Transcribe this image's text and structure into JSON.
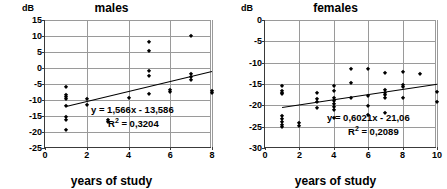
{
  "chart_data": [
    {
      "type": "scatter",
      "title": "males",
      "xlabel": "years of study",
      "ylabel": "dB",
      "xlim": [
        0,
        8
      ],
      "ylim": [
        -25,
        15
      ],
      "xticks": [
        0,
        2,
        4,
        6,
        8
      ],
      "yticks": [
        15,
        10,
        5,
        0,
        -5,
        -10,
        -15,
        -20,
        -25
      ],
      "grid": true,
      "legend": "none",
      "equation": "y = 1,566x - 13,586",
      "r2_label": "R",
      "r2_sup": "2",
      "r2_value": " = 0,3204",
      "trendline": {
        "slope": 1.566,
        "intercept": -13.586,
        "x_start": 1,
        "x_end": 8
      },
      "points": [
        {
          "x": 1,
          "y": -6.0
        },
        {
          "x": 1,
          "y": -8.3
        },
        {
          "x": 1,
          "y": -9.0
        },
        {
          "x": 1,
          "y": -9.6
        },
        {
          "x": 1,
          "y": -11.9
        },
        {
          "x": 1,
          "y": -15.4
        },
        {
          "x": 1,
          "y": -16.3
        },
        {
          "x": 1,
          "y": -19.4
        },
        {
          "x": 2,
          "y": -9.7
        },
        {
          "x": 2,
          "y": -11.7
        },
        {
          "x": 3,
          "y": -16.2
        },
        {
          "x": 3,
          "y": -17.0
        },
        {
          "x": 4,
          "y": -9.4
        },
        {
          "x": 5,
          "y": 8.1
        },
        {
          "x": 5,
          "y": 5.2
        },
        {
          "x": 5,
          "y": -1.0
        },
        {
          "x": 5,
          "y": -2.4
        },
        {
          "x": 5,
          "y": -8.0
        },
        {
          "x": 6,
          "y": -6.8
        },
        {
          "x": 6,
          "y": -7.6
        },
        {
          "x": 7,
          "y": 10.1
        },
        {
          "x": 7,
          "y": -1.8
        },
        {
          "x": 7,
          "y": -2.8
        },
        {
          "x": 7,
          "y": -3.9
        },
        {
          "x": 8,
          "y": -7.3
        },
        {
          "x": 8,
          "y": -7.9
        }
      ]
    },
    {
      "type": "scatter",
      "title": "females",
      "xlabel": "years of study",
      "ylabel": "dB",
      "xlim": [
        0,
        10
      ],
      "ylim": [
        -30,
        0
      ],
      "xticks": [
        0,
        2,
        4,
        6,
        8,
        10
      ],
      "yticks": [
        0,
        -5,
        -10,
        -15,
        -20,
        -25,
        -30
      ],
      "grid": true,
      "legend": "none",
      "equation": "y = 0,6021x - 21,06",
      "r2_label": "R",
      "r2_sup": "2",
      "r2_value": " = 0,2089",
      "trendline": {
        "slope": 0.6021,
        "intercept": -21.06,
        "x_start": 1,
        "x_end": 10
      },
      "points": [
        {
          "x": 1,
          "y": -15.4
        },
        {
          "x": 1,
          "y": -16.6
        },
        {
          "x": 1,
          "y": -17.0
        },
        {
          "x": 1,
          "y": -17.4
        },
        {
          "x": 1,
          "y": -22.6
        },
        {
          "x": 1,
          "y": -23.3
        },
        {
          "x": 1,
          "y": -24.0
        },
        {
          "x": 1,
          "y": -24.6
        },
        {
          "x": 1,
          "y": -25.1
        },
        {
          "x": 2,
          "y": -24.1
        },
        {
          "x": 2,
          "y": -24.8
        },
        {
          "x": 3,
          "y": -17.2
        },
        {
          "x": 3,
          "y": -18.6
        },
        {
          "x": 3,
          "y": -19.2
        },
        {
          "x": 3,
          "y": -20.6
        },
        {
          "x": 4,
          "y": -15.4
        },
        {
          "x": 4,
          "y": -16.7
        },
        {
          "x": 4,
          "y": -18.3
        },
        {
          "x": 4,
          "y": -19.0
        },
        {
          "x": 4,
          "y": -19.7
        },
        {
          "x": 4,
          "y": -20.4
        },
        {
          "x": 4,
          "y": -21.2
        },
        {
          "x": 4,
          "y": -22.9
        },
        {
          "x": 5,
          "y": -11.4
        },
        {
          "x": 5,
          "y": -14.8
        },
        {
          "x": 5,
          "y": -18.2
        },
        {
          "x": 6,
          "y": -11.5
        },
        {
          "x": 6,
          "y": -17.8
        },
        {
          "x": 6,
          "y": -20.1
        },
        {
          "x": 6,
          "y": -22.3
        },
        {
          "x": 7,
          "y": -12.4
        },
        {
          "x": 7,
          "y": -16.3
        },
        {
          "x": 7,
          "y": -17.0
        },
        {
          "x": 7,
          "y": -17.6
        },
        {
          "x": 7,
          "y": -18.3
        },
        {
          "x": 7,
          "y": -21.7
        },
        {
          "x": 8,
          "y": -12.2
        },
        {
          "x": 8,
          "y": -15.2
        },
        {
          "x": 8,
          "y": -15.8
        },
        {
          "x": 8,
          "y": -18.2
        },
        {
          "x": 9,
          "y": -12.7
        },
        {
          "x": 10,
          "y": -16.9
        },
        {
          "x": 10,
          "y": -19.3
        }
      ]
    }
  ]
}
